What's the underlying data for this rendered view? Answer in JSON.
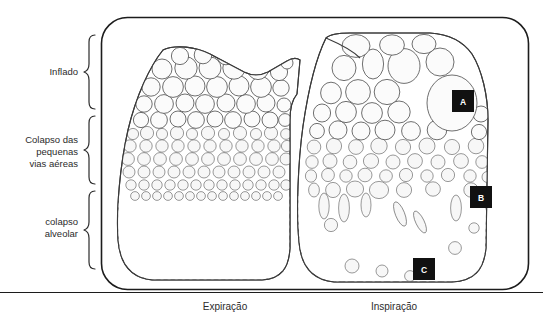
{
  "figure": {
    "zones": [
      {
        "id": "inflado",
        "label": "Inflado",
        "description": "inflated alveoli zone"
      },
      {
        "id": "colapso-pequenas-vias",
        "label": "Colapso das\npequenas\nvias aéreas",
        "line1": "Colapso das",
        "line2": "pequenas",
        "line3": "vias aéreas",
        "description": "small airway collapse zone"
      },
      {
        "id": "colapso-alveolar",
        "label": "colapso\nalveolar",
        "line1": "colapso",
        "line2": "alveolar",
        "description": "alveolar collapse zone"
      }
    ],
    "panels": [
      {
        "id": "expiracao",
        "caption": "Expiração",
        "side": "left"
      },
      {
        "id": "inspiracao",
        "caption": "Inspiração",
        "side": "right"
      }
    ],
    "markers": [
      {
        "id": "a",
        "label": "A",
        "panel": "inspiracao",
        "zone": "inflado",
        "x": 463,
        "y": 101
      },
      {
        "id": "b",
        "label": "B",
        "panel": "inspiracao",
        "zone": "colapso-pequenas-vias",
        "x": 481,
        "y": 197
      },
      {
        "id": "c",
        "label": "C",
        "panel": "inspiracao",
        "zone": "colapso-alveolar",
        "x": 424,
        "y": 269
      }
    ],
    "colors": {
      "frame_border": "#1c1c1c",
      "background": "#ffffff",
      "zone_inflated": "#e9e9e9",
      "zone_middle": "#9a9a9a",
      "zone_collapsed": "#4f4f4f",
      "alveolus_fill": "#fbfbfb",
      "alveolus_stroke": "#4a4a4a",
      "marker_background": "#111111",
      "marker_text": "#ffffff",
      "text": "#2b2b2b"
    }
  }
}
